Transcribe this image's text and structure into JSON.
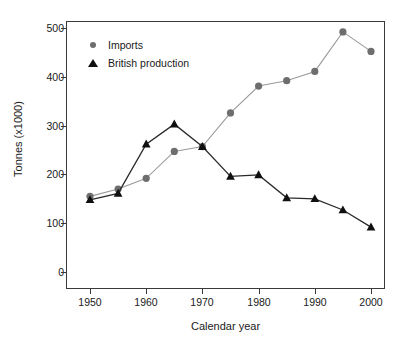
{
  "chart_data": {
    "type": "line",
    "title": "",
    "subtitle": "",
    "xlabel": "Calendar year",
    "ylabel": "Tonnes (x1000)",
    "xlim": [
      1948,
      2002
    ],
    "ylim": [
      0,
      515
    ],
    "xticks": [
      1950,
      1960,
      1970,
      1980,
      1990,
      2000
    ],
    "xtick_labels": [
      "1950",
      "1960",
      "1970",
      "1980",
      "1990",
      "2000"
    ],
    "yticks": [
      0,
      100,
      200,
      300,
      400,
      500
    ],
    "ytick_labels": [
      "0",
      "100",
      "200",
      "300",
      "400",
      "500"
    ],
    "grid": false,
    "legend_position": "top-left",
    "x": [
      1950,
      1955,
      1960,
      1965,
      1970,
      1975,
      1980,
      1985,
      1990,
      1995,
      2000
    ],
    "series": [
      {
        "name": "Imports",
        "marker": "circle",
        "color": "#6e6e6e",
        "line_color": "#9a9a9a",
        "values": [
          155,
          170,
          192,
          247,
          257,
          326,
          381,
          392,
          411,
          492,
          452
        ]
      },
      {
        "name": "British production",
        "marker": "triangle",
        "color": "#101010",
        "line_color": "#2a2a2a",
        "values": [
          148,
          161,
          262,
          303,
          257,
          196,
          199,
          152,
          150,
          127,
          92
        ]
      }
    ],
    "annotations": []
  },
  "legend": {
    "items": [
      {
        "label": "Imports",
        "icon": "circle-marker-icon"
      },
      {
        "label": "British production",
        "icon": "triangle-marker-icon"
      }
    ]
  },
  "axes": {
    "x_title": "Calendar year",
    "y_title": "Tonnes (x1000)"
  }
}
